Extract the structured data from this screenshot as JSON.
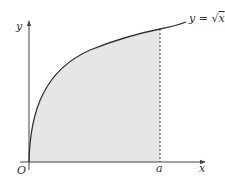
{
  "diagram": {
    "axes": {
      "x_label": "x",
      "y_label": "y",
      "origin_label": "O"
    },
    "curve": {
      "label": "y = √x",
      "label_lhs": "y = ",
      "label_rhs": "x"
    },
    "bound": {
      "label": "a"
    },
    "colors": {
      "shade": "#e6e6e6",
      "line": "#333333",
      "axis": "#444444"
    }
  }
}
